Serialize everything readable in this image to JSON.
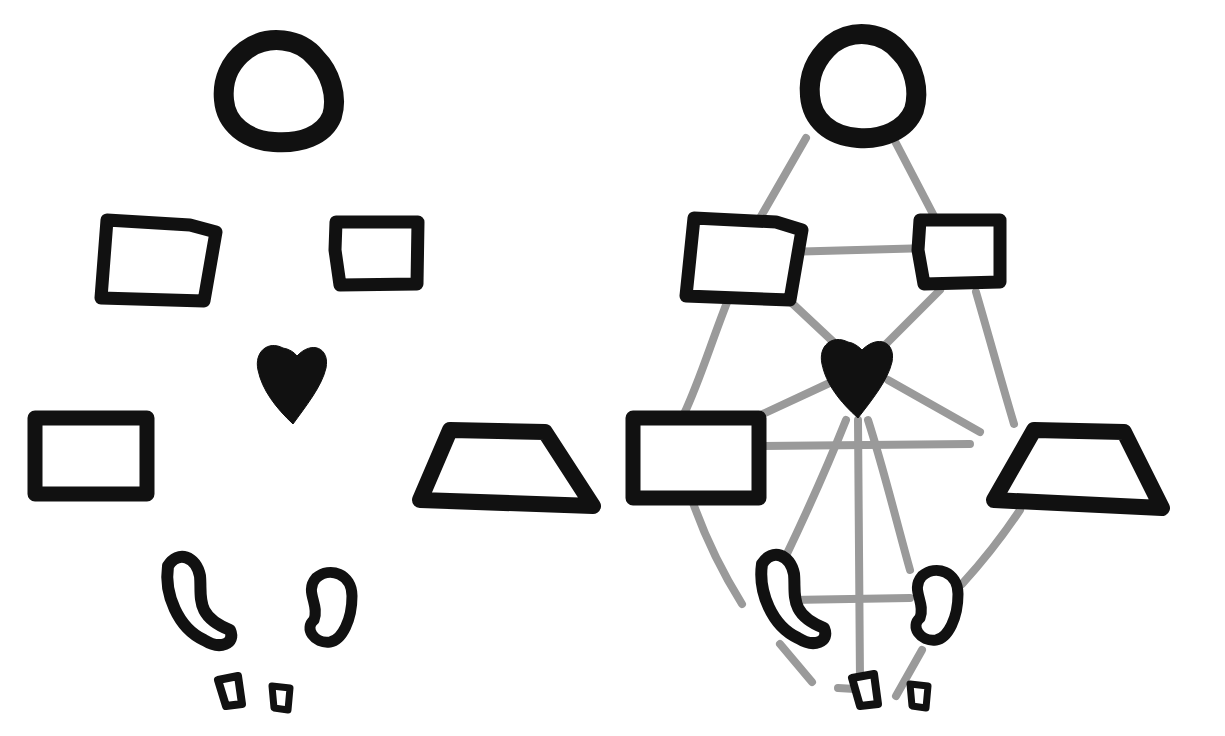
{
  "diagram": {
    "colors": {
      "shape": "#111111",
      "edge": "#9a9a9a",
      "background": "#ffffff"
    },
    "panels": [
      {
        "id": "left",
        "nodes": [
          {
            "id": "head",
            "shape": "circle"
          },
          {
            "id": "upper-left",
            "shape": "square"
          },
          {
            "id": "upper-right",
            "shape": "square"
          },
          {
            "id": "heart",
            "shape": "heart"
          },
          {
            "id": "mid-left",
            "shape": "rectangle"
          },
          {
            "id": "mid-right",
            "shape": "trapezoid"
          },
          {
            "id": "lower-left",
            "shape": "bean"
          },
          {
            "id": "lower-right",
            "shape": "bean"
          },
          {
            "id": "foot-left",
            "shape": "small-square"
          },
          {
            "id": "foot-right",
            "shape": "small-square"
          }
        ],
        "edges": []
      },
      {
        "id": "right",
        "nodes": [
          "head",
          "upper-left",
          "upper-right",
          "heart",
          "mid-left",
          "mid-right",
          "lower-left",
          "lower-right",
          "foot-left",
          "foot-right"
        ],
        "edges": [
          [
            "head",
            "upper-left"
          ],
          [
            "head",
            "upper-right"
          ],
          [
            "upper-left",
            "upper-right"
          ],
          [
            "upper-left",
            "heart"
          ],
          [
            "upper-right",
            "heart"
          ],
          [
            "upper-left",
            "mid-left"
          ],
          [
            "upper-right",
            "mid-right"
          ],
          [
            "heart",
            "mid-left"
          ],
          [
            "heart",
            "mid-right"
          ],
          [
            "mid-left",
            "mid-right"
          ],
          [
            "heart",
            "lower-left"
          ],
          [
            "heart",
            "lower-right"
          ],
          [
            "heart",
            "foot-left"
          ],
          [
            "mid-left",
            "lower-left"
          ],
          [
            "mid-right",
            "lower-right"
          ],
          [
            "lower-left",
            "lower-right"
          ],
          [
            "lower-left",
            "foot-left"
          ],
          [
            "lower-right",
            "foot-right"
          ],
          [
            "foot-left",
            "foot-right"
          ]
        ]
      }
    ]
  }
}
